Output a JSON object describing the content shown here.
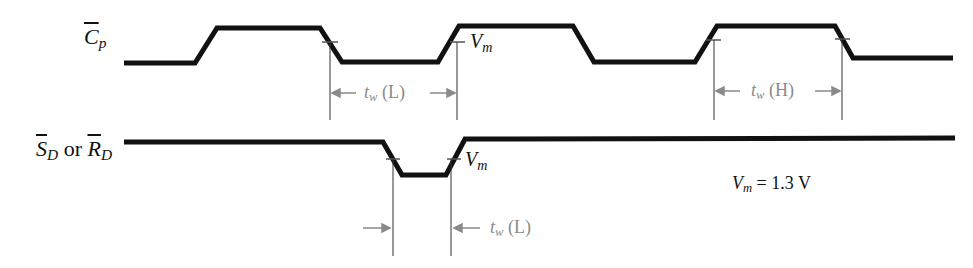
{
  "signals": [
    {
      "id": "cp",
      "name_letter": "C",
      "name_sub": "p",
      "overbar": true
    },
    {
      "id": "sd_rd",
      "part1_letter": "S",
      "part1_sub": "D",
      "connector": "or",
      "part2_letter": "R",
      "part2_sub": "D",
      "overbar": true
    }
  ],
  "annotations": {
    "vm_label_letter": "V",
    "vm_label_sub": "m",
    "tw_low": {
      "t": "t",
      "sub": "w",
      "suffix": "(L)"
    },
    "tw_high": {
      "t": "t",
      "sub": "w",
      "suffix": "(H)"
    },
    "vm_value": {
      "letter": "V",
      "sub": "m",
      "text": "= 1.3 V"
    }
  },
  "colors": {
    "waveform": "#111111",
    "dimension": "#8a8a8a",
    "text": "#111111",
    "background": "#ffffff"
  }
}
